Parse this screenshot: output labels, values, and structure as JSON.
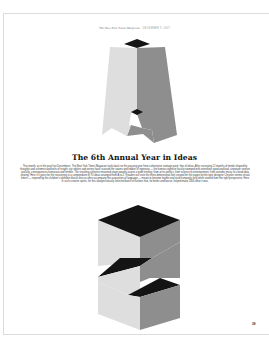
{
  "header": {
    "masthead": "The New York Times Magazine",
    "date": "DECEMBER 9, 2007"
  },
  "illustrations": {
    "top_letter": "A",
    "bottom_letter": "Z",
    "colors": {
      "top_face": "#141414",
      "light_face": "#dedede",
      "dark_face": "#8e8e8e",
      "shadow": "#1a1a1a"
    }
  },
  "article": {
    "title": "The 6th Annual Year in Ideas",
    "body": "This month, as in the past five Decembers, The New York Times Magazine looks back on the passing year from a distinctive vantage point: that of ideas. After surveying 12 months of minds shaped by thoughts and schemes and bolts of insight, our editors and writers have scoured the seams and eddies of ingenuity — the human cognitive faculty stamped with inventions good and bad, corporate venture and ally, consequences humorous and terrible. The resulting collective mounted stage awards across a wide territory, from art to politics, from science to entertainment, from outsider music to closed data sharing. Here it's yours for the recovering in a compendium of 70 ideas arranged from A to Z. Readers will note the three-dimensional font created for the pages by the type designer Chrysler seems virtual letters — inspired by the children's alphabet blocks that so often accompany the acquisition of language — meant to become legible and vivid humanely only when viewed from the right perspective. Here in such creative spirits, for this idiosyncratically selected batch of notions that, for better and worse, helped make 2006 what it was."
  },
  "footer": {
    "page_number": "39"
  }
}
